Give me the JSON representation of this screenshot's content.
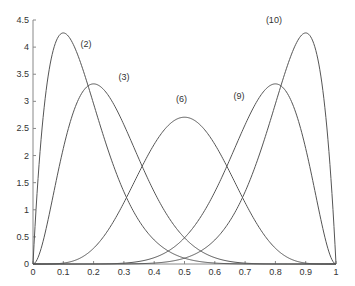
{
  "chart_data": {
    "type": "line",
    "title": "",
    "xlabel": "",
    "ylabel": "",
    "xlim": [
      0,
      1
    ],
    "ylim": [
      0,
      4.5
    ],
    "grid": false,
    "legend": null,
    "x_ticks": [
      "0",
      "0.1",
      "0.2",
      "0.3",
      "0.4",
      "0.5",
      "0.6",
      "0.7",
      "0.8",
      "0.9",
      "1"
    ],
    "y_ticks": [
      "0",
      "0.5",
      "1",
      "1.5",
      "2",
      "2.5",
      "3",
      "3.5",
      "4",
      "4.5"
    ],
    "x": [
      0,
      0.05,
      0.1,
      0.15,
      0.2,
      0.25,
      0.3,
      0.35,
      0.4,
      0.45,
      0.5,
      0.55,
      0.6,
      0.65,
      0.7,
      0.75,
      0.8,
      0.85,
      0.9,
      0.95,
      1
    ],
    "series": [
      {
        "name": "(2)",
        "alpha": 2,
        "beta": 10,
        "peak_x": 0.1,
        "peak_y": 4.26,
        "values": [
          0,
          3.47,
          4.26,
          3.76,
          2.95,
          2.11,
          1.4,
          0.87,
          0.5,
          0.27,
          0.13,
          0.06,
          0.02,
          0.01,
          0.0,
          0.0,
          0.0,
          0.0,
          0.0,
          0.0,
          0
        ]
      },
      {
        "name": "(3)",
        "alpha": 3,
        "beta": 9,
        "peak_x": 0.2,
        "peak_y": 3.32,
        "values": [
          0,
          0.82,
          2.13,
          2.98,
          3.32,
          3.1,
          2.54,
          1.87,
          1.26,
          0.77,
          0.44,
          0.23,
          0.11,
          0.04,
          0.02,
          0.0,
          0.0,
          0.0,
          0.0,
          0.0,
          0
        ]
      },
      {
        "name": "(6)",
        "alpha": 6,
        "beta": 6,
        "peak_x": 0.5,
        "peak_y": 2.71,
        "values": [
          0,
          0.0,
          0.04,
          0.18,
          0.48,
          0.91,
          1.42,
          1.92,
          2.34,
          2.62,
          2.71,
          2.62,
          2.34,
          1.92,
          1.42,
          0.91,
          0.48,
          0.18,
          0.04,
          0.0,
          0
        ]
      },
      {
        "name": "(9)",
        "alpha": 9,
        "beta": 3,
        "peak_x": 0.8,
        "peak_y": 3.32,
        "values": [
          0,
          0.0,
          0.0,
          0.0,
          0.0,
          0.0,
          0.02,
          0.04,
          0.11,
          0.23,
          0.44,
          0.77,
          1.26,
          1.87,
          2.54,
          3.1,
          3.32,
          2.98,
          2.13,
          0.82,
          0
        ]
      },
      {
        "name": "(10)",
        "alpha": 10,
        "beta": 2,
        "peak_x": 0.9,
        "peak_y": 4.26,
        "values": [
          0,
          0.0,
          0.0,
          0.0,
          0.0,
          0.0,
          0.0,
          0.01,
          0.02,
          0.06,
          0.13,
          0.27,
          0.5,
          0.87,
          1.4,
          2.11,
          2.95,
          3.76,
          4.26,
          3.47,
          0
        ]
      }
    ],
    "annotations": [
      {
        "text": "(2)",
        "x": 0.175,
        "y": 4.0
      },
      {
        "text": "(3)",
        "x": 0.3,
        "y": 3.4
      },
      {
        "text": "(6)",
        "x": 0.49,
        "y": 2.99
      },
      {
        "text": "(9)",
        "x": 0.68,
        "y": 3.05
      },
      {
        "text": "(10)",
        "x": 0.795,
        "y": 4.45
      }
    ],
    "line_color": "#555555",
    "axis_color": "#888888"
  }
}
